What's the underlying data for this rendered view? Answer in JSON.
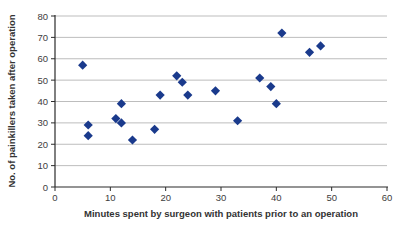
{
  "chart_data": {
    "type": "scatter",
    "title": "",
    "xlabel": "Minutes spent by surgeon with patients prior to an operation",
    "ylabel": "No. of painkillers taken after operation",
    "xlim": [
      0,
      60
    ],
    "ylim": [
      0,
      80
    ],
    "x_ticks": [
      0,
      10,
      20,
      30,
      40,
      50,
      60
    ],
    "y_ticks": [
      0,
      10,
      20,
      30,
      40,
      50,
      60,
      70,
      80
    ],
    "grid": "horizontal",
    "legend": "none",
    "marker": "diamond",
    "colors": {
      "marker": "#1a3a8c",
      "gridline": "#bdbdbd",
      "axis": "#2b2b2b",
      "tick_label": "#3d3d3d",
      "title_text": "#333333",
      "background": "#ffffff"
    },
    "points": [
      [
        5,
        57
      ],
      [
        6,
        24
      ],
      [
        6,
        29
      ],
      [
        11,
        32
      ],
      [
        12,
        30
      ],
      [
        12,
        39
      ],
      [
        14,
        22
      ],
      [
        18,
        27
      ],
      [
        19,
        43
      ],
      [
        22,
        52
      ],
      [
        23,
        49
      ],
      [
        24,
        43
      ],
      [
        29,
        45
      ],
      [
        33,
        31
      ],
      [
        37,
        51
      ],
      [
        39,
        47
      ],
      [
        40,
        39
      ],
      [
        41,
        72
      ],
      [
        46,
        63
      ],
      [
        48,
        66
      ]
    ]
  }
}
